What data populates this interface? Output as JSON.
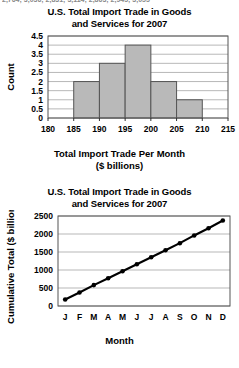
{
  "page": {
    "top_cut_text": "2,764; 3,036; 2,831; 3,114; 2,863; 2,945; 3,055",
    "background_color": "#ffffff"
  },
  "figures": [
    {
      "id": "histogram",
      "title_line1": "U.S. Total Import Trade in Goods",
      "title_line2": "and Services for 2007",
      "xlabel_line1": "Total Import Trade Per Month",
      "xlabel_line2": "($ billions)",
      "ylabel": "Count"
    },
    {
      "id": "ogive",
      "title_line1": "U.S. Total Import Trade in Goods",
      "title_line2": "and Services for 2007",
      "xlabel": "Month",
      "ylabel": "Cumulative Total ($ billions)"
    }
  ],
  "chart_data": [
    {
      "type": "bar",
      "id": "histogram",
      "title": "U.S. Total Import Trade in Goods and Services for 2007",
      "xlabel": "Total Import Trade Per Month ($ billions)",
      "ylabel": "Count",
      "bin_edges": [
        180,
        185,
        190,
        195,
        200,
        205,
        210,
        215
      ],
      "categories": [
        "180-185",
        "185-190",
        "190-195",
        "195-200",
        "200-205",
        "205-210",
        "210-215"
      ],
      "values": [
        0,
        2,
        3,
        4,
        2,
        1,
        0
      ],
      "xlim": [
        180,
        215
      ],
      "ylim": [
        0,
        4.5
      ],
      "xticks": [
        180,
        185,
        190,
        195,
        200,
        205,
        210,
        215
      ],
      "yticks": [
        0,
        0.5,
        1,
        1.5,
        2,
        2.5,
        3,
        3.5,
        4,
        4.5
      ],
      "ytick_labels": [
        "0",
        "0.5",
        "1",
        "1.5",
        "2",
        "2.5",
        "3",
        "3.5",
        "4",
        "4.5"
      ],
      "bar_fill": "#b9b9b9",
      "bar_stroke": "#555555",
      "grid": true,
      "legend": "none"
    },
    {
      "type": "line",
      "id": "ogive",
      "title": "U.S. Total Import Trade in Goods and Services for 2007",
      "xlabel": "Month",
      "ylabel": "Cumulative Total ($ billions)",
      "categories": [
        "J",
        "F",
        "M",
        "A",
        "M",
        "J",
        "J",
        "A",
        "S",
        "O",
        "N",
        "D"
      ],
      "month_names": [
        "January",
        "February",
        "March",
        "April",
        "May",
        "June",
        "July",
        "August",
        "September",
        "October",
        "November",
        "December"
      ],
      "values": [
        180,
        375,
        580,
        770,
        965,
        1160,
        1355,
        1550,
        1745,
        1960,
        2160,
        2375
      ],
      "ylim": [
        0,
        2500
      ],
      "yticks": [
        0,
        500,
        1000,
        1500,
        2000,
        2500
      ],
      "ytick_labels": [
        "0",
        "500",
        "1000",
        "1500",
        "2000",
        "2500"
      ],
      "line_color": "#000000",
      "marker": "circle",
      "grid": true,
      "legend": "none"
    }
  ]
}
